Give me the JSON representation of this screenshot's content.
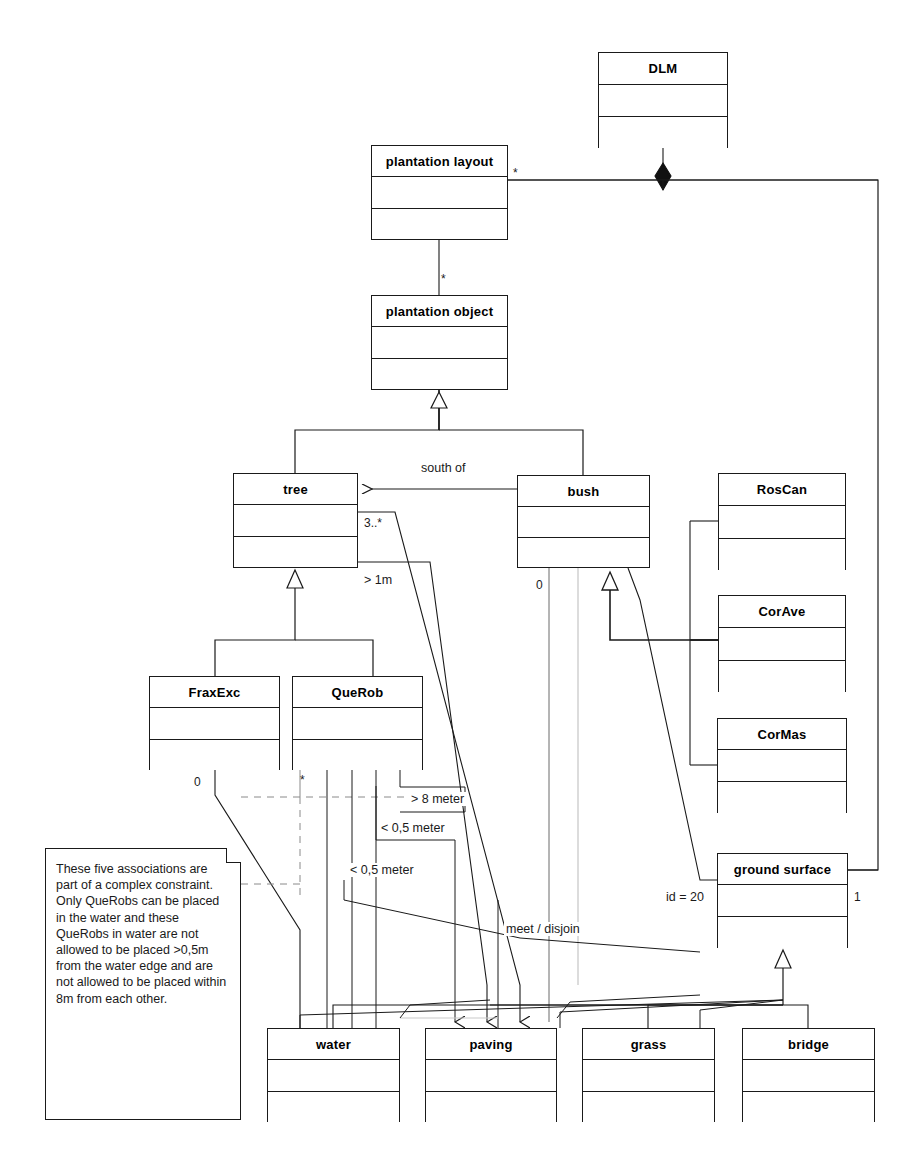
{
  "diagram": {
    "type": "uml-class-diagram",
    "classes": [
      {
        "id": "dlm",
        "name": "DLM",
        "x": 598,
        "y": 52,
        "w": 130,
        "h": 96
      },
      {
        "id": "plantation-layout",
        "name": "plantation layout",
        "x": 371,
        "y": 145,
        "w": 137,
        "h": 95
      },
      {
        "id": "plantation-object",
        "name": "plantation object",
        "x": 371,
        "y": 295,
        "w": 137,
        "h": 95
      },
      {
        "id": "tree",
        "name": "tree",
        "x": 233,
        "y": 473,
        "w": 125,
        "h": 95
      },
      {
        "id": "bush",
        "name": "bush",
        "x": 517,
        "y": 475,
        "w": 133,
        "h": 93
      },
      {
        "id": "roscan",
        "name": "RosCan",
        "x": 718,
        "y": 473,
        "w": 128,
        "h": 97
      },
      {
        "id": "corave",
        "name": "CorAve",
        "x": 718,
        "y": 595,
        "w": 128,
        "h": 97
      },
      {
        "id": "cormas",
        "name": "CorMas",
        "x": 717,
        "y": 718,
        "w": 130,
        "h": 95
      },
      {
        "id": "fraxexc",
        "name": "FraxExc",
        "x": 149,
        "y": 676,
        "w": 131,
        "h": 94
      },
      {
        "id": "querob",
        "name": "QueRob",
        "x": 292,
        "y": 676,
        "w": 131,
        "h": 94
      },
      {
        "id": "ground-surface",
        "name": "ground surface",
        "x": 717,
        "y": 853,
        "w": 131,
        "h": 95
      },
      {
        "id": "water",
        "name": "water",
        "x": 267,
        "y": 1028,
        "w": 133,
        "h": 94
      },
      {
        "id": "paving",
        "name": "paving",
        "x": 425,
        "y": 1028,
        "w": 132,
        "h": 94
      },
      {
        "id": "grass",
        "name": "grass",
        "x": 582,
        "y": 1028,
        "w": 133,
        "h": 94
      },
      {
        "id": "bridge",
        "name": "bridge",
        "x": 742,
        "y": 1028,
        "w": 133,
        "h": 94
      }
    ],
    "labels": [
      {
        "id": "mult-layout-dlm",
        "text": "*",
        "x": 513,
        "y": 166
      },
      {
        "id": "mult-layout-obj",
        "text": "*",
        "x": 441,
        "y": 272
      },
      {
        "id": "assoc-south-of",
        "text": "south of",
        "x": 421,
        "y": 461
      },
      {
        "id": "mult-tree-3",
        "text": "3..*",
        "x": 364,
        "y": 516
      },
      {
        "id": "constraint-1m",
        "text": "> 1m",
        "x": 364,
        "y": 573
      },
      {
        "id": "mult-bush-0",
        "text": "0",
        "x": 536,
        "y": 578
      },
      {
        "id": "mult-fraxexc-0",
        "text": "0",
        "x": 194,
        "y": 775
      },
      {
        "id": "mult-querob-star",
        "text": "*",
        "x": 300,
        "y": 773
      },
      {
        "id": "constraint-8m",
        "text": "> 8 meter",
        "x": 409,
        "y": 792
      },
      {
        "id": "constraint-05m-a",
        "text": "< 0,5 meter",
        "x": 379,
        "y": 821
      },
      {
        "id": "constraint-05m-b",
        "text": "< 0,5 meter",
        "x": 348,
        "y": 863
      },
      {
        "id": "constraint-meet",
        "text": "meet / disjoin",
        "x": 504,
        "y": 922
      },
      {
        "id": "constraint-id20",
        "text": "id = 20",
        "x": 664,
        "y": 890
      },
      {
        "id": "mult-ground-1",
        "text": "1",
        "x": 854,
        "y": 890
      }
    ],
    "note": {
      "id": "complex-constraint-note",
      "x": 45,
      "y": 848,
      "w": 196,
      "h": 272,
      "text": "These five associations are part of a complex constraint. Only QueRobs can be placed in the water and these QueRobs in water are not  allowed to be placed >0,5m from the water edge and are not allowed to be placed within 8m from each other."
    },
    "colors": {
      "stroke": "#1a1a1a",
      "fill": "#ffffff",
      "text": "#000000"
    }
  }
}
